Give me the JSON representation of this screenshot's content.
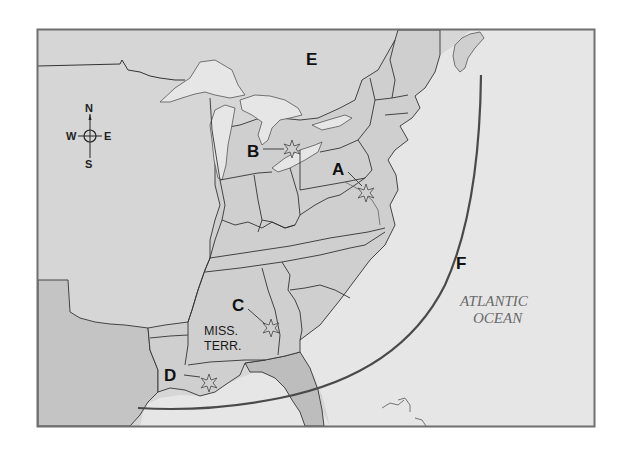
{
  "map": {
    "title": "",
    "colors": {
      "frame": "#6f6f6f",
      "background_land": "#d6d6d6",
      "us_states": "#cfcfcf",
      "territory_dark": "#bdbdbd",
      "water": "#e6e6e6",
      "borders": "#333333",
      "arc": "#4a4a4a"
    },
    "compass": {
      "north": "N",
      "south": "S",
      "east": "E",
      "west": "W"
    },
    "labels": {
      "a": "A",
      "b": "B",
      "c": "C",
      "d": "D",
      "e": "E",
      "f": "F"
    },
    "region_labels": {
      "miss_terr_line1": "MISS.",
      "miss_terr_line2": "TERR.",
      "ocean_line1": "ATLANTIC",
      "ocean_line2": "OCEAN"
    },
    "markers": [
      {
        "id": "A",
        "type": "battle-star",
        "location": "near Washington/Baltimore"
      },
      {
        "id": "B",
        "type": "battle-star",
        "location": "near Lake Erie / Detroit"
      },
      {
        "id": "C",
        "type": "battle-star",
        "location": "Mississippi Territory (Horseshoe Bend)"
      },
      {
        "id": "D",
        "type": "battle-star",
        "location": "New Orleans"
      }
    ],
    "features": {
      "E": "British North America (Canada)",
      "F": "British naval blockade line"
    }
  }
}
